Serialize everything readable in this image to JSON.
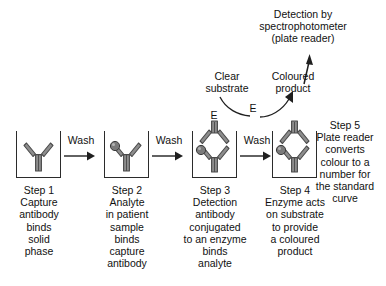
{
  "diagram": {
    "title_text": "ELISA sandwich assay workflow",
    "top_annotation": {
      "name": "detection-annotation",
      "text": "Detection by\nspectrophotometer\n(plate reader)"
    },
    "substrate_annotation": {
      "name": "clear-substrate",
      "text": "Clear\nsubstrate"
    },
    "product_annotation": {
      "name": "coloured-product",
      "text": "Coloured\nproduct"
    },
    "enzyme_symbol": "E",
    "wash_label": "Wash",
    "steps": [
      {
        "id": "step-1",
        "number": "Step 1",
        "caption": "Step 1\nCapture\nantibody\nbinds\nsolid\nphase",
        "has_analyte": false,
        "has_detection_antibody": false,
        "has_enzyme": false
      },
      {
        "id": "step-2",
        "number": "Step 2",
        "caption": "Step 2\nAnalyte\nin patient\nsample\nbinds\ncapture\nantibody",
        "has_analyte": true,
        "has_detection_antibody": false,
        "has_enzyme": false
      },
      {
        "id": "step-3",
        "number": "Step 3",
        "caption": "Step 3\nDetection\nantibody\nconjugated\nto an enzyme\nbinds\nanalyte",
        "has_analyte": true,
        "has_detection_antibody": true,
        "has_enzyme": true
      },
      {
        "id": "step-4",
        "number": "Step 4",
        "caption": "Step 4\nEnzyme acts\non substrate\nto provide\na coloured\nproduct",
        "has_analyte": true,
        "has_detection_antibody": true,
        "has_enzyme": true
      }
    ],
    "step5": {
      "id": "step-5",
      "number": "Step 5",
      "caption": "Step 5\nPlate reader\nconverts\ncolour to a\nnumber for\nthe standard\ncurve"
    },
    "wash_arrows": [
      {
        "id": "wash-arrow-1",
        "label": "Wash"
      },
      {
        "id": "wash-arrow-2",
        "label": "Wash"
      },
      {
        "id": "wash-arrow-3",
        "label": "Wash"
      }
    ],
    "colors": {
      "background": "#ffffff",
      "outline": "#2b2b2b",
      "antibody_fill": "#8d8d8d",
      "antibody_stroke": "#4a4a4a",
      "analyte_fill": "#7a7a7a",
      "analyte_stroke": "#3a3a3a",
      "text": "#111111",
      "arrow": "#1f1f1f"
    }
  }
}
